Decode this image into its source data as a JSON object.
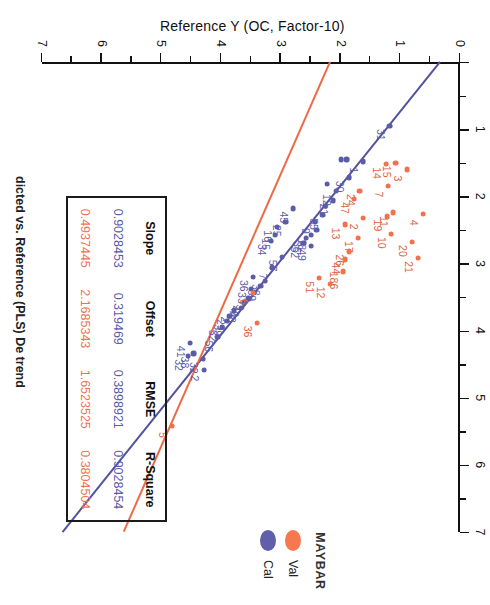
{
  "figure": {
    "title": "dicted vs. Reference (PLS) De trend",
    "x_axis_title": "Predicted Y (OC, Factor-10)",
    "y_axis_title": "Reference Y (OC, Factor-10)"
  },
  "legend": {
    "title": "MAYBAR",
    "items": [
      {
        "label": "Val",
        "color": "#f5784f"
      },
      {
        "label": "Cal",
        "color": "#5f5faa"
      }
    ]
  },
  "stats_table": {
    "headers": [
      "Slope",
      "Offset",
      "RMSE",
      "R-Square"
    ],
    "rows": [
      {
        "series": "Cal",
        "color": "#5b5ba8",
        "values": [
          "0.9028453",
          "0.319469",
          "0.3898921",
          "0.9028454"
        ]
      },
      {
        "series": "Val",
        "color": "#ef7351",
        "values": [
          "0.4937445",
          "2.1685343",
          "1.6523525",
          "0.3804504"
        ]
      }
    ]
  },
  "chart_data": {
    "type": "scatter",
    "title": "dicted vs. Reference (PLS) De trend",
    "xlabel": "Predicted Y (OC, Factor-10)",
    "ylabel": "Reference Y (OC, Factor-10)",
    "xlim": [
      0,
      7
    ],
    "ylim": [
      0,
      7
    ],
    "xticks": [
      1,
      2,
      3,
      4,
      5,
      6,
      7
    ],
    "yticks": [
      0,
      1,
      2,
      3,
      4,
      5,
      6,
      7
    ],
    "grid": false,
    "legend_position": "bottom-right",
    "fit_lines": [
      {
        "name": "Cal",
        "color": "#5153a0",
        "slope": 0.9028453,
        "intercept": 0.319469
      },
      {
        "name": "Val",
        "color": "#ee6a44",
        "slope": 0.4937445,
        "intercept": 2.1685343
      }
    ],
    "series": [
      {
        "name": "Cal",
        "color": "#5b5ba8",
        "points": [
          {
            "x": 0.95,
            "y": 1.18,
            "label": "31"
          },
          {
            "x": 1.48,
            "y": 1.62,
            "label": "1"
          },
          {
            "x": 1.45,
            "y": 1.9,
            "label": ""
          },
          {
            "x": 1.45,
            "y": 1.99,
            "label": ""
          },
          {
            "x": 1.72,
            "y": 1.86,
            "label": "30"
          },
          {
            "x": 1.92,
            "y": 2.08,
            "label": "12"
          },
          {
            "x": 1.82,
            "y": 2.22,
            "label": ""
          },
          {
            "x": 2.06,
            "y": 2.12,
            "label": "21"
          },
          {
            "x": 2.14,
            "y": 2.26,
            "label": ""
          },
          {
            "x": 2.28,
            "y": 2.3,
            "label": "55"
          },
          {
            "x": 2.38,
            "y": 2.42,
            "label": "9"
          },
          {
            "x": 2.5,
            "y": 2.4,
            "label": ""
          },
          {
            "x": 2.58,
            "y": 2.5,
            "label": "18"
          },
          {
            "x": 2.62,
            "y": 2.58,
            "label": "35"
          },
          {
            "x": 2.7,
            "y": 2.62,
            "label": "52"
          },
          {
            "x": 2.74,
            "y": 2.5,
            "label": "49"
          },
          {
            "x": 2.18,
            "y": 2.8,
            "label": "45"
          },
          {
            "x": 2.38,
            "y": 2.92,
            "label": "25"
          },
          {
            "x": 2.46,
            "y": 3.06,
            "label": "16"
          },
          {
            "x": 2.58,
            "y": 3.1,
            "label": "15"
          },
          {
            "x": 2.66,
            "y": 3.16,
            "label": "34"
          },
          {
            "x": 2.9,
            "y": 2.98,
            "label": "57"
          },
          {
            "x": 3.06,
            "y": 3.14,
            "label": "7"
          },
          {
            "x": 3.26,
            "y": 3.26,
            "label": "38"
          },
          {
            "x": 3.34,
            "y": 3.34,
            "label": "39"
          },
          {
            "x": 3.2,
            "y": 3.46,
            "label": "36"
          },
          {
            "x": 3.38,
            "y": 3.5,
            "label": "33"
          },
          {
            "x": 3.52,
            "y": 3.54,
            "label": "3"
          },
          {
            "x": 3.58,
            "y": 3.62,
            "label": "40"
          },
          {
            "x": 3.66,
            "y": 3.66,
            "label": "48"
          },
          {
            "x": 3.7,
            "y": 3.78,
            "label": "2"
          },
          {
            "x": 3.78,
            "y": 3.86,
            "label": "29"
          },
          {
            "x": 3.86,
            "y": 3.9,
            "label": "39"
          },
          {
            "x": 3.94,
            "y": 3.98,
            "label": "52"
          },
          {
            "x": 4.1,
            "y": 4.06,
            "label": "56"
          },
          {
            "x": 4.42,
            "y": 4.3,
            "label": "32"
          },
          {
            "x": 4.58,
            "y": 4.28,
            "label": "2"
          },
          {
            "x": 4.18,
            "y": 4.52,
            "label": "41"
          },
          {
            "x": 4.34,
            "y": 4.46,
            "label": "38"
          },
          {
            "x": 4.38,
            "y": 4.56,
            "label": "32"
          }
        ]
      },
      {
        "name": "Val",
        "color": "#f0714a",
        "points": [
          {
            "x": 1.6,
            "y": 0.88,
            "label": "3"
          },
          {
            "x": 1.5,
            "y": 1.08,
            "label": "15"
          },
          {
            "x": 1.52,
            "y": 1.24,
            "label": "14"
          },
          {
            "x": 1.84,
            "y": 1.2,
            "label": "7"
          },
          {
            "x": 2.26,
            "y": 0.62,
            "label": "4"
          },
          {
            "x": 2.68,
            "y": 0.8,
            "label": "20"
          },
          {
            "x": 2.92,
            "y": 0.7,
            "label": "21"
          },
          {
            "x": 2.24,
            "y": 1.12,
            "label": "11"
          },
          {
            "x": 2.3,
            "y": 1.22,
            "label": "19"
          },
          {
            "x": 2.56,
            "y": 1.16,
            "label": "10"
          },
          {
            "x": 1.92,
            "y": 1.68,
            "label": "24"
          },
          {
            "x": 2.04,
            "y": 1.78,
            "label": "47"
          },
          {
            "x": 2.32,
            "y": 1.62,
            "label": "2"
          },
          {
            "x": 2.62,
            "y": 1.7,
            "label": "17"
          },
          {
            "x": 2.42,
            "y": 1.92,
            "label": "13"
          },
          {
            "x": 2.82,
            "y": 1.86,
            "label": "26"
          },
          {
            "x": 2.94,
            "y": 1.92,
            "label": "44"
          },
          {
            "x": 3.12,
            "y": 1.96,
            "label": "186"
          },
          {
            "x": 3.3,
            "y": 2.18,
            "label": "12"
          },
          {
            "x": 3.22,
            "y": 2.36,
            "label": "51"
          },
          {
            "x": 3.44,
            "y": 3.46,
            "label": "6"
          },
          {
            "x": 3.88,
            "y": 3.4,
            "label": "36"
          },
          {
            "x": 5.42,
            "y": 4.82,
            "label": "5"
          }
        ]
      }
    ]
  }
}
